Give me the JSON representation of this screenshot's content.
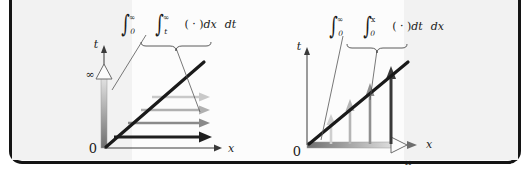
{
  "figure": {
    "kind": "math-diagram",
    "frame_color": "#141414",
    "background": "#fcfcfc",
    "panel_tint": "#f2f2f2"
  },
  "panels": [
    {
      "id": "left",
      "formula": {
        "outer_integral_symbol": "∫",
        "outer_lower": "0",
        "outer_upper": "∞",
        "inner_integral_symbol": "∫",
        "inner_lower": "t",
        "inner_upper": "∞",
        "integrand": "( · )",
        "inner_differential": "dx",
        "outer_differential": "dt",
        "plain": "∫₀^∞ ∫ₜ^∞ ( · )dx dt"
      },
      "axes": {
        "vertical_label": "t",
        "horizontal_label": "x",
        "origin_label": "0",
        "infinity_label": "∞",
        "infinity_on": "t-axis",
        "sweep_axis": "t",
        "sweep_direction": "upward"
      },
      "diagonal": {
        "label": "t = x",
        "color": "#1a1a1a"
      },
      "rays": {
        "orientation": "horizontal",
        "direction": "rightward",
        "count": 4,
        "colors": [
          "#c9c9c9",
          "#b0b0b0",
          "#8a8a8a",
          "#1f1f1f"
        ],
        "note": "inner dx integration from the diagonal out to infinity"
      },
      "brace": {
        "spans": "inner integral",
        "points_to": "horizontal rays"
      },
      "leader": {
        "from": "outer integral",
        "points_to": "t-axis gradient bar"
      }
    },
    {
      "id": "right",
      "formula": {
        "outer_integral_symbol": "∫",
        "outer_lower": "0",
        "outer_upper": "∞",
        "inner_integral_symbol": "∫",
        "inner_lower": "0",
        "inner_upper": "x",
        "integrand": "( · )",
        "inner_differential": "dt",
        "outer_differential": "dx",
        "plain": "∫₀^∞ ∫₀^x ( · )dt dx"
      },
      "axes": {
        "vertical_label": "t",
        "horizontal_label": "x",
        "origin_label": "0",
        "infinity_label": "∞",
        "infinity_on": "x-axis",
        "sweep_axis": "x",
        "sweep_direction": "rightward"
      },
      "diagonal": {
        "label": "t = x",
        "color": "#1a1a1a"
      },
      "rays": {
        "orientation": "vertical",
        "direction": "upward",
        "count": 4,
        "colors": [
          "#cfcfcf",
          "#b5b5b5",
          "#8f8f8f",
          "#3a3a3a"
        ],
        "note": "inner dt integration from the x-axis up to the diagonal"
      },
      "brace": {
        "spans": "inner integral",
        "points_to": "vertical rays"
      },
      "leader": {
        "from": "outer integral",
        "points_to": "x-axis gradient bar"
      }
    }
  ]
}
